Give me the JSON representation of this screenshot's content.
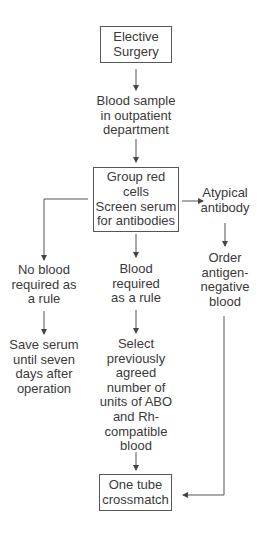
{
  "diagram": {
    "nodes": {
      "elective_surgery": {
        "lines": [
          "Elective",
          "Surgery"
        ],
        "boxed": true
      },
      "blood_sample": {
        "lines": [
          "Blood sample",
          "in outpatient",
          "department"
        ],
        "boxed": false
      },
      "group_screen": {
        "lines": [
          "Group red",
          "cells",
          "Screen serum",
          "for antibodies"
        ],
        "boxed": true
      },
      "atypical_antibody": {
        "lines": [
          "Atypical",
          "antibody"
        ],
        "boxed": false
      },
      "order_antigen_negative": {
        "lines": [
          "Order",
          "antigen-",
          "negative",
          "blood"
        ],
        "boxed": false
      },
      "no_blood_required": {
        "lines": [
          "No blood",
          "required as",
          "a rule"
        ],
        "boxed": false
      },
      "save_serum": {
        "lines": [
          "Save serum",
          "until seven",
          "days after",
          "operation"
        ],
        "boxed": false
      },
      "blood_required": {
        "lines": [
          "Blood",
          "required",
          "as a rule"
        ],
        "boxed": false
      },
      "select_units": {
        "lines": [
          "Select",
          "previously",
          "agreed",
          "number of",
          "units of ABO",
          "and Rh-",
          "compatible",
          "blood"
        ],
        "boxed": false
      },
      "one_tube_crossmatch": {
        "lines": [
          "One tube",
          "crossmatch"
        ],
        "boxed": true
      }
    },
    "edges": [
      {
        "from": "elective_surgery",
        "to": "blood_sample"
      },
      {
        "from": "blood_sample",
        "to": "group_screen"
      },
      {
        "from": "group_screen",
        "to": "atypical_antibody"
      },
      {
        "from": "group_screen",
        "to": "no_blood_required"
      },
      {
        "from": "group_screen",
        "to": "blood_required"
      },
      {
        "from": "atypical_antibody",
        "to": "order_antigen_negative"
      },
      {
        "from": "no_blood_required",
        "to": "save_serum"
      },
      {
        "from": "blood_required",
        "to": "select_units"
      },
      {
        "from": "select_units",
        "to": "one_tube_crossmatch"
      },
      {
        "from": "order_antigen_negative",
        "to": "one_tube_crossmatch"
      }
    ],
    "colors": {
      "line": "#555555",
      "text": "#3a3a3a",
      "background": "#ffffff"
    }
  }
}
